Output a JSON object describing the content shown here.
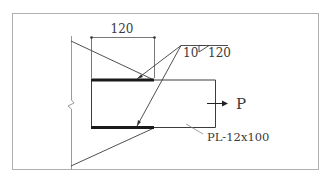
{
  "diagram": {
    "type": "weld-connection-detail",
    "dimension": {
      "label": "120"
    },
    "weld_symbol": {
      "size": "10",
      "length": "120"
    },
    "load": {
      "label": "P"
    },
    "plate": {
      "label": "PL-12x100"
    }
  },
  "colors": {
    "frame": "#b0b0b0",
    "line": "#3c3c3c",
    "weld": "#1a1a1a",
    "wall": "#9a9a9a"
  }
}
